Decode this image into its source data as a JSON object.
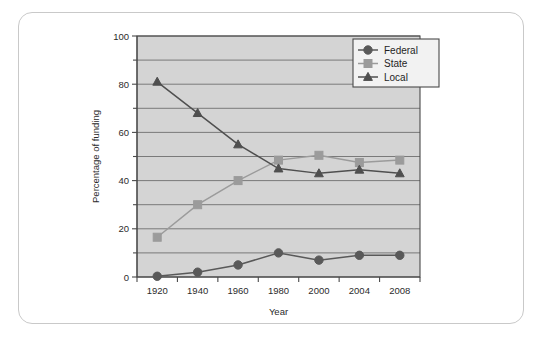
{
  "chart_data": {
    "type": "line",
    "title": "",
    "subtitle": "",
    "xlabel": "Year",
    "ylabel": "Percentage of funding",
    "categories": [
      "1920",
      "1940",
      "1960",
      "1980",
      "2000",
      "2004",
      "2008"
    ],
    "ylim": [
      0,
      100
    ],
    "y_major_ticks": [
      0,
      20,
      40,
      60,
      80,
      100
    ],
    "y_minor_ticks": [
      10,
      30,
      50,
      70,
      90
    ],
    "y_tick_labels": [
      "0",
      "20",
      "40",
      "60",
      "80",
      "100"
    ],
    "grid": "horizontal",
    "legend_position": "top-right",
    "series": [
      {
        "name": "Federal",
        "marker": "circle",
        "color": "#595959",
        "values": [
          0.3,
          2,
          5,
          10,
          7,
          9,
          9
        ]
      },
      {
        "name": "State",
        "marker": "square",
        "color": "#9b9b9b",
        "values": [
          16.5,
          30,
          40,
          48.5,
          50.5,
          47.5,
          48.5
        ]
      },
      {
        "name": "Local",
        "marker": "triangle",
        "color": "#4f4f4f",
        "values": [
          81,
          68,
          55,
          45,
          43,
          44.5,
          43
        ]
      }
    ]
  },
  "axes": {
    "y_label": "Percentage of funding",
    "x_label": "Year",
    "y_ticks": [
      "0",
      "20",
      "40",
      "60",
      "80",
      "100"
    ],
    "x_ticks": [
      "1920",
      "1940",
      "1960",
      "1980",
      "2000",
      "2004",
      "2008"
    ]
  },
  "legend": {
    "entries": [
      {
        "label": "Federal",
        "icon": "circle-marker-icon"
      },
      {
        "label": "State",
        "icon": "square-marker-icon"
      },
      {
        "label": "Local",
        "icon": "triangle-marker-icon"
      }
    ]
  },
  "colors": {
    "plot_background": "#d4d4d4",
    "card_background": "#ffffff",
    "card_border": "#c9c9c9",
    "axis": "#4a4a4a",
    "gridline": "#6f6f6f",
    "federal": "#595959",
    "state": "#9b9b9b",
    "local": "#4f4f4f"
  }
}
